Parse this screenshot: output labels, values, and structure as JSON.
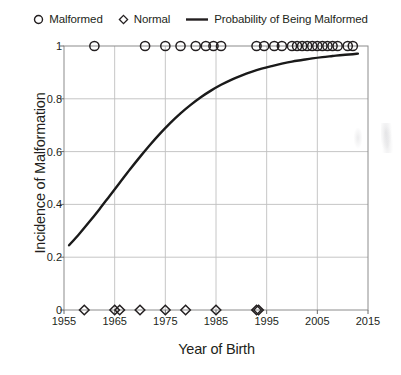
{
  "legend": {
    "items": [
      {
        "label": "Malformed",
        "marker": "circle-open-marker"
      },
      {
        "label": "Normal",
        "marker": "diamond-open-marker"
      },
      {
        "label": "Probability of Being Malformed",
        "marker": "line-marker"
      }
    ]
  },
  "chart_data": {
    "type": "scatter",
    "title": "",
    "xlabel": "Year of Birth",
    "ylabel": "Incidence of Malformation",
    "xlim": [
      1955,
      2015
    ],
    "ylim": [
      0,
      1
    ],
    "xticks": [
      1955,
      1965,
      1975,
      1985,
      1995,
      2005,
      2015
    ],
    "xtick_labels": [
      "1955",
      "1965",
      "1975",
      "1985",
      "1995",
      "2005",
      "2015"
    ],
    "yticks": [
      0,
      0.2,
      0.4,
      0.6,
      0.8,
      1
    ],
    "ytick_labels": [
      "0",
      "0.2",
      "0.4",
      "0.6",
      "0.8",
      "1"
    ],
    "grid": true,
    "grid_color": "#bfbfbf",
    "legend_position": "top",
    "series": [
      {
        "name": "Malformed",
        "type": "scatter",
        "marker": "circle-open",
        "color": "#231f20",
        "y_value": 1,
        "x": [
          1961,
          1971,
          1975,
          1978,
          1981,
          1983,
          1984.5,
          1986,
          1993,
          1994.5,
          1996.5,
          1998,
          2000,
          2001,
          2002,
          2003,
          2004,
          2005,
          2006,
          2007,
          2008,
          2009,
          2011,
          2012
        ],
        "count": 24
      },
      {
        "name": "Normal",
        "type": "scatter",
        "marker": "diamond-open",
        "color": "#231f20",
        "y_value": 0,
        "x": [
          1959,
          1965,
          1966,
          1970,
          1975,
          1979,
          1985,
          1993,
          1993.4
        ],
        "count": 9
      },
      {
        "name": "Probability of Being Malformed",
        "type": "line",
        "color": "#1a1a1a",
        "x": [
          1956,
          1958,
          1960,
          1962,
          1964,
          1966,
          1968,
          1970,
          1972,
          1974,
          1976,
          1978,
          1980,
          1982,
          1984,
          1986,
          1988,
          1990,
          1992,
          1994,
          1996,
          1998,
          2000,
          2002,
          2004,
          2006,
          2008,
          2010,
          2012,
          2013
        ],
        "values": [
          0.245,
          0.288,
          0.334,
          0.382,
          0.432,
          0.482,
          0.532,
          0.58,
          0.626,
          0.669,
          0.709,
          0.745,
          0.777,
          0.806,
          0.831,
          0.853,
          0.872,
          0.888,
          0.902,
          0.914,
          0.924,
          0.933,
          0.941,
          0.947,
          0.953,
          0.958,
          0.962,
          0.966,
          0.969,
          0.971
        ]
      }
    ]
  }
}
